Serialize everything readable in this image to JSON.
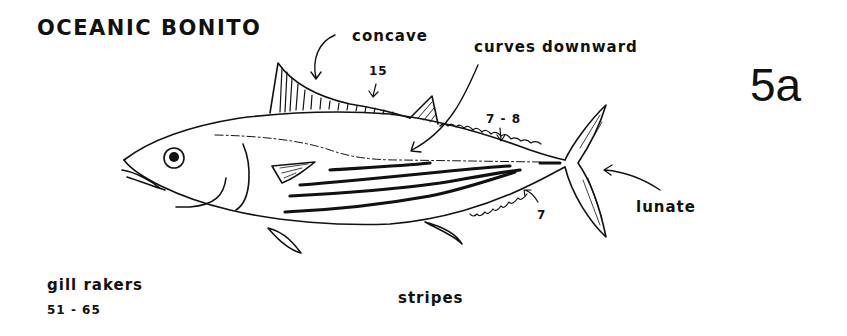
{
  "title": "OCEANIC BONITO",
  "plate_number": "5a",
  "annotations": {
    "dorsal_fin_shape": "concave",
    "dorsal_spines": "15",
    "lateral_line": "curves downward",
    "dorsal_finlets": "7 - 8",
    "anal_finlets": "7",
    "caudal_fin_shape": "lunate",
    "gill_rakers_label": "gill rakers",
    "gill_rakers_count": "51 - 65",
    "body_marking": "stripes"
  },
  "colors": {
    "ink": "#111111",
    "background": "#ffffff"
  }
}
